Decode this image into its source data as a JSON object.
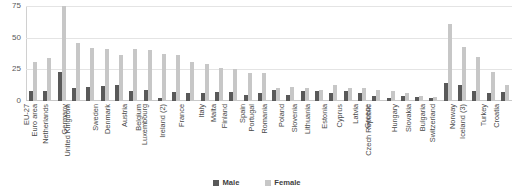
{
  "chart_data": {
    "type": "bar",
    "title": "",
    "subtitle": "",
    "xlabel": "",
    "ylabel": "",
    "ylim": [
      0,
      75
    ],
    "yticks": [
      0,
      25,
      50,
      75
    ],
    "ytick_labels": [
      "0",
      "25",
      "50",
      "75"
    ],
    "grid": true,
    "legend_position": "bottom",
    "categories": [
      "EU-27",
      "Euro area",
      "Netherlands",
      "Germany",
      "United Kingdom",
      "Sweden",
      "Denmark",
      "Austria",
      "Belgium",
      "Luxembourg",
      "Ireland (2)",
      "France",
      "Italy",
      "Malta",
      "Finland",
      "Spain",
      "Portugal",
      "Romania",
      "Poland",
      "Slovenia",
      "Lithuania",
      "Estonia",
      "Cyprus",
      "Latvia",
      "Greece",
      "Czech Republic",
      "Hungary",
      "Slovakia",
      "Bulgaria",
      "Switzerland",
      "Norway",
      "Iceland (3)",
      "Turkey",
      "Croatia"
    ],
    "series": [
      {
        "name": "Male",
        "color": "#595959",
        "values": [
          8,
          8,
          23,
          10,
          11,
          12,
          13,
          8,
          9,
          2,
          7,
          6,
          6,
          7,
          7,
          5,
          6,
          9,
          5,
          8,
          8,
          6,
          8,
          6,
          4,
          2,
          4,
          3,
          2,
          14,
          13,
          8,
          6,
          7
        ]
      },
      {
        "name": "Female",
        "color": "#c7c7c7",
        "values": [
          31,
          34,
          75,
          46,
          42,
          41,
          36,
          41,
          40,
          37,
          36,
          31,
          29,
          26,
          25,
          22,
          22,
          10,
          11,
          10,
          9,
          13,
          10,
          10,
          9,
          8,
          6,
          4,
          3,
          61,
          43,
          35,
          23,
          13
        ]
      }
    ]
  },
  "legend": {
    "items": [
      {
        "label": "Male",
        "swatch": "male-swatch"
      },
      {
        "label": "Female",
        "swatch": "female-swatch"
      }
    ]
  }
}
